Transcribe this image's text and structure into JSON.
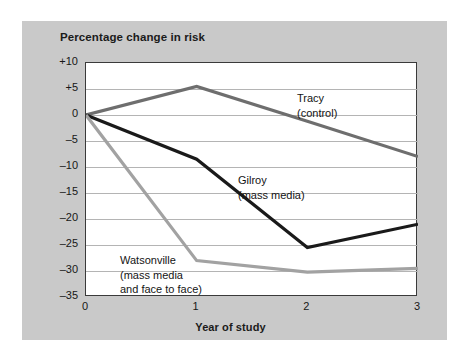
{
  "chart_data": {
    "type": "line",
    "title": "Percentage change in risk",
    "xlabel": "Year of study",
    "ylabel": "",
    "x": [
      0,
      1,
      2,
      3
    ],
    "xticklabels": [
      "0",
      "1",
      "2",
      "3"
    ],
    "xlim": [
      0,
      3
    ],
    "ylim": [
      -35,
      10
    ],
    "yticks": [
      10,
      5,
      0,
      -5,
      -10,
      -15,
      -20,
      -25,
      -30,
      -35
    ],
    "yticklabels": [
      "+10",
      "+5",
      "0",
      "-5",
      "-10",
      "-15",
      "-20",
      "-25",
      "-30",
      "-35"
    ],
    "grid": "horizontal",
    "legend": "inline annotations",
    "series": [
      {
        "name": "Tracy (control)",
        "label_lines": [
          "Tracy",
          "(control)"
        ],
        "color": "#6e6e6e",
        "values": [
          0,
          5.5,
          -1.2,
          -8
        ]
      },
      {
        "name": "Gilroy (mass media)",
        "label_lines": [
          "Gilroy",
          "(mass media)"
        ],
        "color": "#1a1a1a",
        "values": [
          0,
          -8.5,
          -25.5,
          -21
        ]
      },
      {
        "name": "Watsonville (mass media and face to face)",
        "label_lines": [
          "Watsonville",
          "(mass media",
          "and face to face)"
        ],
        "color": "#a2a2a2",
        "values": [
          0,
          -28,
          -30.2,
          -29.5
        ]
      }
    ]
  },
  "figure": {
    "panel_color": "#c9c9c9",
    "plot_background": "#ffffff",
    "axis_color": "#3a3a3a",
    "gridline_color": "#b4b4b4"
  }
}
